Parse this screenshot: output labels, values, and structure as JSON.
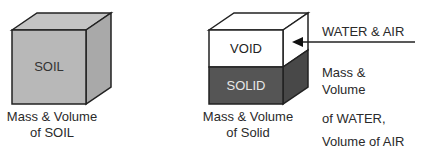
{
  "diagram": {
    "soil_cube": {
      "face_label": "SOIL",
      "caption_line1": "Mass & Volume",
      "caption_line2": "of SOIL",
      "colors": {
        "front": "#b8b8b8",
        "top": "#c4c4c4",
        "side": "#a9a9a9",
        "stroke": "#222222"
      }
    },
    "phase_cube": {
      "void_label": "VOID",
      "solid_label": "SOLID",
      "caption_line1": "Mass & Volume",
      "caption_line2": "of Solid",
      "colors": {
        "void": "#ffffff",
        "solid": "#555555",
        "solid_side": "#484848",
        "stroke": "#222222"
      }
    },
    "annotation": {
      "arrow_label": "WATER & AIR",
      "line1": "Mass &",
      "line2": "Volume",
      "line3": "of WATER,",
      "line4": "Volume of AIR"
    }
  }
}
